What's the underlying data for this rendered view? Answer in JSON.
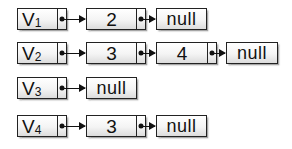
{
  "diagram": {
    "type": "adjacency-list",
    "lists": [
      {
        "head": {
          "label": "V",
          "subscript": "1"
        },
        "nodes": [
          "2"
        ],
        "terminator": "null"
      },
      {
        "head": {
          "label": "V",
          "subscript": "2"
        },
        "nodes": [
          "3",
          "4"
        ],
        "terminator": "null"
      },
      {
        "head": {
          "label": "V",
          "subscript": "3"
        },
        "nodes": [],
        "terminator": "null"
      },
      {
        "head": {
          "label": "V",
          "subscript": "4"
        },
        "nodes": [
          "3"
        ],
        "terminator": "null"
      }
    ]
  },
  "colors": {
    "border": "#222222",
    "fill_top": "#ffffff",
    "fill_bottom": "#dcdcdc",
    "text": "#111111"
  }
}
